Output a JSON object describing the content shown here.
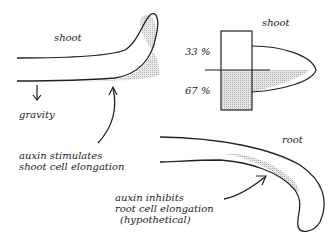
{
  "labels": {
    "shoot_main": "shoot",
    "gravity": "gravity",
    "auxin_shoot_1": "auxin stimulates",
    "auxin_shoot_2": "shoot cell elongation",
    "shoot_inset": "shoot",
    "pct_top": "33 %",
    "pct_bottom": "67 %",
    "root": "root",
    "auxin_root_1": "auxin inhibits",
    "auxin_root_2": "root cell elongation",
    "auxin_root_3": "(hypothetical)"
  },
  "colors": {
    "stroke": "#222222",
    "shade": "#c8c8c8"
  }
}
